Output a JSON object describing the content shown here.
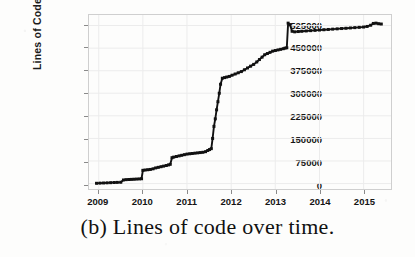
{
  "caption": "(b) Lines of code over time.",
  "colors": {
    "series": "#111111",
    "frame": "#cfcfcf",
    "grid": "#ececec",
    "text": "#141414",
    "background": "#fdfdfc"
  },
  "chart_data": {
    "type": "line",
    "title": "",
    "xlabel": "",
    "ylabel": "Lines of Code",
    "xlim": [
      2008.78,
      2015.62
    ],
    "ylim": [
      -18000,
      560000
    ],
    "grid": true,
    "legend": null,
    "marker": "square",
    "ytick_labels": [
      "0",
      "75000",
      "150000",
      "225000",
      "300000",
      "375000",
      "450000",
      "525000"
    ],
    "ytick_values": [
      0,
      75000,
      150000,
      225000,
      300000,
      375000,
      450000,
      525000
    ],
    "xtick_labels": [
      "2009",
      "2010",
      "2011",
      "2012",
      "2013",
      "2014",
      "2015"
    ],
    "xtick_values": [
      2009,
      2010,
      2011,
      2012,
      2013,
      2014,
      2015
    ],
    "series": [
      {
        "name": "Lines of Code",
        "x": [
          2008.95,
          2009.03,
          2009.11,
          2009.19,
          2009.27,
          2009.35,
          2009.42,
          2009.5,
          2009.56,
          2009.62,
          2009.68,
          2009.74,
          2009.8,
          2009.86,
          2009.92,
          2009.97,
          2010.0,
          2010.05,
          2010.11,
          2010.17,
          2010.23,
          2010.29,
          2010.35,
          2010.41,
          2010.47,
          2010.53,
          2010.58,
          2010.62,
          2010.66,
          2010.7,
          2010.76,
          2010.82,
          2010.88,
          2010.94,
          2011.0,
          2011.06,
          2011.12,
          2011.18,
          2011.24,
          2011.3,
          2011.36,
          2011.42,
          2011.47,
          2011.51,
          2011.55,
          2011.58,
          2011.61,
          2011.64,
          2011.67,
          2011.7,
          2011.73,
          2011.76,
          2011.8,
          2011.85,
          2011.9,
          2011.96,
          2012.02,
          2012.09,
          2012.16,
          2012.23,
          2012.3,
          2012.37,
          2012.44,
          2012.51,
          2012.58,
          2012.64,
          2012.7,
          2012.76,
          2012.82,
          2012.88,
          2012.94,
          2013.0,
          2013.06,
          2013.12,
          2013.18,
          2013.22,
          2013.26,
          2013.29,
          2013.33,
          2013.38,
          2013.44,
          2013.52,
          2013.6,
          2013.7,
          2013.8,
          2013.9,
          2014.0,
          2014.1,
          2014.2,
          2014.3,
          2014.4,
          2014.5,
          2014.6,
          2014.7,
          2014.8,
          2014.9,
          2015.0,
          2015.08,
          2015.16,
          2015.22,
          2015.28,
          2015.34,
          2015.4
        ],
        "y": [
          1000,
          1500,
          2000,
          2500,
          3000,
          3500,
          4000,
          4500,
          12000,
          13000,
          13500,
          14000,
          14500,
          15000,
          15500,
          16000,
          44000,
          45000,
          46000,
          47000,
          49000,
          52000,
          54000,
          56000,
          58000,
          60000,
          62000,
          64000,
          86000,
          88000,
          90000,
          92000,
          94000,
          96000,
          98000,
          99000,
          100000,
          101000,
          102000,
          103000,
          104000,
          106000,
          110000,
          113000,
          116000,
          150000,
          190000,
          215000,
          245000,
          272000,
          300000,
          330000,
          350000,
          352000,
          354000,
          356000,
          360000,
          364000,
          368000,
          372000,
          378000,
          384000,
          390000,
          396000,
          404000,
          412000,
          420000,
          428000,
          432000,
          436000,
          440000,
          442000,
          444000,
          446000,
          448000,
          450000,
          451000,
          533000,
          528000,
          506000,
          504000,
          505000,
          506000,
          507000,
          508000,
          509000,
          510000,
          511000,
          512000,
          513000,
          514000,
          515000,
          516000,
          517000,
          518000,
          519000,
          520000,
          522000,
          526000,
          532000,
          533000,
          531000,
          530000
        ]
      }
    ]
  }
}
